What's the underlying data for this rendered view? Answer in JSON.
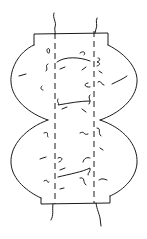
{
  "figure": {
    "stroke_color": "#1a1a1a",
    "background": "#ffffff"
  }
}
